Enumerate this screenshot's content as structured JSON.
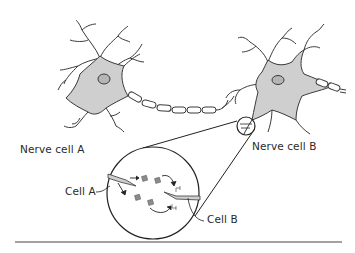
{
  "diagram": {
    "labels": {
      "nerve_cell_a": "Nerve cell A",
      "nerve_cell_b": "Nerve cell B",
      "cell_a": "Cell A",
      "cell_b": "Cell B"
    },
    "colors": {
      "cell_fill": "#cfcfcf",
      "nucleus_fill": "#b5b5b5",
      "outline": "#3a3a3a",
      "neurotransmitter": "#8c8c8c",
      "line": "#222222"
    }
  }
}
